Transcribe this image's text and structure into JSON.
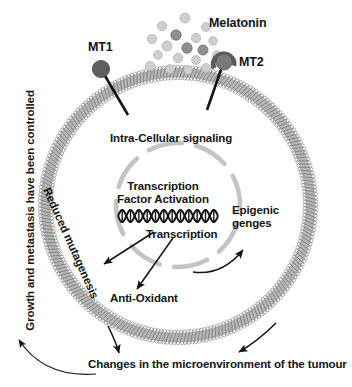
{
  "figure": {
    "type": "biological-pathway-diagram"
  },
  "labels": {
    "melatonin": "Melatonin",
    "mt1": "MT1",
    "mt2": "MT2",
    "intra_cellular_signaling": "Intra-Cellular signaling",
    "transcription_factor_activation": "Transcription\nFactor Activation",
    "transcription_factor_activation_line1": "Transcription",
    "transcription_factor_activation_line2": "Factor Activation",
    "transcription": "Transcription",
    "epigenic_line1": "Epigenic",
    "epigenic_line2": "genges",
    "anti_oxidant": "Anti-Oxidant",
    "reduced_mutagenesis": "Reduced mutagenesis",
    "growth_controlled": "Growth and metastasis have been controlled",
    "changes_microenvironment": "Changes in the microenvironment of the tumour"
  },
  "colors": {
    "ink": "#141414",
    "membrane": "#9a9a9a",
    "membrane_light": "#c9c9c9",
    "receptor_dark": "#5d5d5d",
    "receptor_mid": "#6e6e6e",
    "ligand_light": "#cfcfcf",
    "ligand_dark": "#8f8f8f",
    "nucleus_dash": "#c2c2c2",
    "background": "#ffffff"
  },
  "cell": {
    "center_x": 178,
    "center_y": 205,
    "outer_radius": 138,
    "membrane_thickness": 11,
    "nucleus_radius": 62,
    "nucleus_dash_count": 8
  },
  "ligands": [
    {
      "x": 185,
      "y": 18,
      "r": 5.0,
      "tone": "light"
    },
    {
      "x": 162,
      "y": 26,
      "r": 4.6,
      "tone": "light"
    },
    {
      "x": 206,
      "y": 27,
      "r": 4.4,
      "tone": "light"
    },
    {
      "x": 176,
      "y": 35,
      "r": 5.2,
      "tone": "dark"
    },
    {
      "x": 196,
      "y": 38,
      "r": 4.6,
      "tone": "light"
    },
    {
      "x": 152,
      "y": 39,
      "r": 4.6,
      "tone": "light"
    },
    {
      "x": 213,
      "y": 41,
      "r": 4.2,
      "tone": "light"
    },
    {
      "x": 167,
      "y": 46,
      "r": 5.0,
      "tone": "light"
    },
    {
      "x": 187,
      "y": 48,
      "r": 5.2,
      "tone": "dark"
    },
    {
      "x": 203,
      "y": 50,
      "r": 5.0,
      "tone": "dark"
    },
    {
      "x": 158,
      "y": 55,
      "r": 4.4,
      "tone": "light"
    },
    {
      "x": 178,
      "y": 58,
      "r": 4.6,
      "tone": "light"
    },
    {
      "x": 217,
      "y": 55,
      "r": 4.2,
      "tone": "light"
    },
    {
      "x": 196,
      "y": 60,
      "r": 4.4,
      "tone": "light"
    },
    {
      "x": 150,
      "y": 66,
      "r": 4.6,
      "tone": "light"
    },
    {
      "x": 170,
      "y": 69,
      "r": 4.4,
      "tone": "light"
    },
    {
      "x": 188,
      "y": 70,
      "r": 4.2,
      "tone": "light"
    },
    {
      "x": 206,
      "y": 68,
      "r": 4.4,
      "tone": "light"
    }
  ],
  "receptors": [
    {
      "name": "MT1",
      "head_x": 101,
      "head_y": 69,
      "head_r": 8.5,
      "stem_x": 128,
      "stem_y": 113,
      "has_cup": false
    },
    {
      "name": "MT2",
      "head_x": 224,
      "head_y": 62,
      "head_r": 8.0,
      "stem_x": 207,
      "stem_y": 108,
      "has_cup": true
    }
  ],
  "arrows": [
    {
      "name": "dna-to-reduced-mutagenesis",
      "from": [
        153,
        231
      ],
      "to": [
        103,
        263
      ]
    },
    {
      "name": "dna-to-anti-oxidant",
      "from": [
        172,
        237
      ],
      "to": [
        136,
        290
      ]
    },
    {
      "name": "nucleus-to-epigenic",
      "from": [
        196,
        268
      ],
      "to": [
        246,
        248
      ],
      "curved": true
    },
    {
      "name": "cell-to-changes-left",
      "from": [
        110,
        330
      ],
      "to": [
        120,
        355
      ]
    },
    {
      "name": "cell-to-changes-right",
      "from": [
        272,
        330
      ],
      "to": [
        235,
        355
      ]
    },
    {
      "name": "changes-to-growth",
      "from": [
        95,
        372
      ],
      "to": [
        18,
        338
      ],
      "curved": true
    }
  ],
  "dna": {
    "name": "dna-double-helix",
    "x_start": 118,
    "x_end": 218,
    "y_center": 216,
    "amplitude": 6,
    "turns": 6
  }
}
